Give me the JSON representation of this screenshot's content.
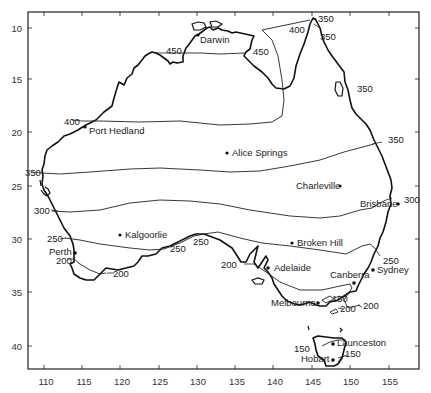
{
  "figure": {
    "type": "isoline map",
    "region": "Australia",
    "frame": {
      "left": 28,
      "top": 12,
      "right": 419,
      "bottom": 369
    }
  },
  "axes": {
    "x_ticks": [
      "110",
      "115",
      "120",
      "125",
      "130",
      "135",
      "140",
      "145",
      "150",
      "155"
    ],
    "y_ticks": [
      "10",
      "15",
      "20",
      "25",
      "30",
      "35",
      "40"
    ]
  },
  "cities": [
    {
      "name": "Darwin"
    },
    {
      "name": "Port Hedland"
    },
    {
      "name": "Alice Springs"
    },
    {
      "name": "Charleville"
    },
    {
      "name": "Brisbane"
    },
    {
      "name": "Kalgoorlie"
    },
    {
      "name": "Broken Hill"
    },
    {
      "name": "Perth"
    },
    {
      "name": "Adelaide"
    },
    {
      "name": "Canberra"
    },
    {
      "name": "Sydney"
    },
    {
      "name": "Melbourne"
    },
    {
      "name": "Launceston"
    },
    {
      "name": "Hobart"
    }
  ],
  "isoline_labels": [
    "350",
    "400",
    "350",
    "450",
    "450",
    "350",
    "400",
    "350",
    "350",
    "300",
    "300",
    "250",
    "250",
    "250",
    "250",
    "200",
    "200",
    "200",
    "200",
    "200",
    "150",
    "150",
    "150"
  ],
  "colors": {
    "ink": "#111111",
    "background": "#ffffff"
  }
}
